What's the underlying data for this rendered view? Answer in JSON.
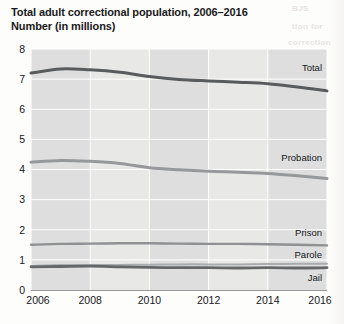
{
  "chart_data": {
    "type": "line",
    "title": "Total adult correctional population, 2006–2016",
    "subtitle": "Number (in millions)",
    "xlabel": "",
    "ylabel": "Number (in millions)",
    "xlim": [
      2006,
      2016
    ],
    "ylim": [
      0,
      8
    ],
    "ytick_labels": [
      "0",
      "1",
      "2",
      "3",
      "4",
      "5",
      "6",
      "7",
      "8"
    ],
    "ytick_values": [
      0,
      1,
      2,
      3,
      4,
      5,
      6,
      7,
      8
    ],
    "xtick_labels": [
      "2006",
      "2008",
      "2010",
      "2012",
      "2014",
      "2016"
    ],
    "xtick_values": [
      2006,
      2008,
      2010,
      2012,
      2014,
      2016
    ],
    "grid": "horizontal-and-vertical-white-on-gray-bands",
    "legend_position": "inline-right-of-each-series",
    "x": [
      2006,
      2007,
      2008,
      2009,
      2010,
      2011,
      2012,
      2013,
      2014,
      2015,
      2016
    ],
    "series": [
      {
        "name": "Total",
        "label": "Total",
        "color": "#595b5d",
        "width": 3.0,
        "values": [
          7.2,
          7.34,
          7.31,
          7.23,
          7.09,
          6.99,
          6.94,
          6.9,
          6.85,
          6.74,
          6.61
        ]
      },
      {
        "name": "Probation",
        "label": "Probation",
        "color": "#96989a",
        "width": 3.0,
        "values": [
          4.24,
          4.3,
          4.27,
          4.2,
          4.06,
          3.99,
          3.94,
          3.91,
          3.87,
          3.79,
          3.7
        ]
      },
      {
        "name": "Prison",
        "label": "Prison",
        "color": "#8e9092",
        "width": 2.4,
        "values": [
          1.5,
          1.53,
          1.54,
          1.55,
          1.55,
          1.54,
          1.53,
          1.53,
          1.52,
          1.5,
          1.48
        ]
      },
      {
        "name": "Parole",
        "label": "Parole",
        "color": "#a9abad",
        "width": 2.0,
        "values": [
          0.8,
          0.83,
          0.83,
          0.83,
          0.84,
          0.85,
          0.85,
          0.85,
          0.86,
          0.87,
          0.87
        ]
      },
      {
        "name": "Jail",
        "label": "Jail",
        "color": "#646668",
        "width": 2.8,
        "values": [
          0.77,
          0.78,
          0.79,
          0.77,
          0.75,
          0.74,
          0.74,
          0.73,
          0.74,
          0.73,
          0.74
        ]
      }
    ],
    "series_label_positions": [
      {
        "name": "Total",
        "x": 322,
        "y": 71
      },
      {
        "name": "Probation",
        "x": 322,
        "y": 161
      },
      {
        "name": "Prison",
        "x": 322,
        "y": 236
      },
      {
        "name": "Parole",
        "x": 322,
        "y": 258
      },
      {
        "name": "Jail",
        "x": 322,
        "y": 281
      }
    ]
  },
  "page_artifacts": {
    "ghost_text_1": "BJS",
    "ghost_text_2": "tion for",
    "ghost_text_3": "correction"
  }
}
